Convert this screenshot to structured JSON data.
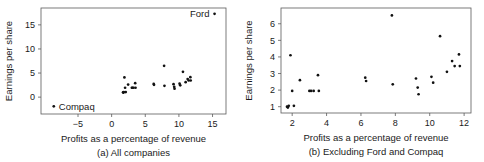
{
  "figure": {
    "background_color": "#ffffff",
    "point_color": "#111111",
    "axis_color": "#5a5a5a"
  },
  "chart_data": [
    {
      "type": "scatter",
      "panel_id": "a",
      "title": "",
      "caption": "(a) All companies",
      "xlabel": "Profits as a percentage of revenue",
      "ylabel": "Earnings per share",
      "xlim": [
        -10.5,
        17.0
      ],
      "ylim": [
        -3.5,
        18.5
      ],
      "xticks": [
        -5,
        0,
        5,
        10,
        15
      ],
      "xtick_labels": [
        "−5",
        "0",
        "5",
        "10",
        "15"
      ],
      "yticks": [
        0,
        5,
        10,
        15
      ],
      "ytick_labels": [
        "0",
        "5",
        "10",
        "15"
      ],
      "grid": false,
      "legend": false,
      "annotations": [
        {
          "text": "Ford",
          "x": 15.3,
          "y": 17.3,
          "position": "left"
        },
        {
          "text": "Compaq",
          "x": -8.6,
          "y": -1.9,
          "position": "right"
        }
      ],
      "x": [
        -8.6,
        1.7,
        1.75,
        1.8,
        1.9,
        2.0,
        2.1,
        2.45,
        3.0,
        3.1,
        3.25,
        3.5,
        3.55,
        6.25,
        6.3,
        7.8,
        7.85,
        9.2,
        9.3,
        9.35,
        10.1,
        10.2,
        10.6,
        11.0,
        11.3,
        11.45,
        11.7,
        11.75,
        15.3
      ],
      "y": [
        -1.9,
        1.0,
        0.95,
        1.05,
        4.1,
        1.95,
        1.05,
        2.6,
        1.95,
        1.95,
        1.95,
        2.9,
        1.95,
        2.75,
        2.55,
        6.5,
        2.35,
        2.7,
        2.15,
        1.75,
        2.8,
        2.45,
        5.25,
        3.1,
        3.75,
        3.45,
        4.15,
        3.45,
        17.3
      ]
    },
    {
      "type": "scatter",
      "panel_id": "b",
      "title": "",
      "caption": "(b) Excluding Ford and Compaq",
      "xlabel": "Profits as a percentage of revenue",
      "ylabel": "Earnings per share",
      "xlim": [
        1.35,
        12.4
      ],
      "ylim": [
        0.62,
        6.95
      ],
      "xticks": [
        2,
        4,
        6,
        8,
        10,
        12
      ],
      "xtick_labels": [
        "2",
        "4",
        "6",
        "8",
        "10",
        "12"
      ],
      "yticks": [
        1,
        2,
        3,
        4,
        5,
        6
      ],
      "ytick_labels": [
        "1",
        "2",
        "3",
        "4",
        "5",
        "6"
      ],
      "grid": false,
      "legend": false,
      "annotations": [],
      "x": [
        1.7,
        1.75,
        1.8,
        1.9,
        2.0,
        2.1,
        2.45,
        3.0,
        3.1,
        3.25,
        3.5,
        3.55,
        6.25,
        6.3,
        7.8,
        7.85,
        9.2,
        9.3,
        9.35,
        10.1,
        10.2,
        10.6,
        11.0,
        11.3,
        11.45,
        11.7,
        11.75
      ],
      "y": [
        1.0,
        0.95,
        1.05,
        4.1,
        1.95,
        1.05,
        2.6,
        1.95,
        1.95,
        1.95,
        2.9,
        1.95,
        2.75,
        2.55,
        6.5,
        2.35,
        2.7,
        2.15,
        1.75,
        2.8,
        2.45,
        5.25,
        3.1,
        3.75,
        3.45,
        4.15,
        3.45
      ]
    }
  ]
}
